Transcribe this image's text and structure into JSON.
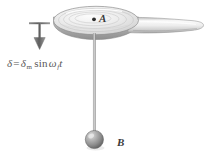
{
  "figure": {
    "name": "oscillating-paddle-pendulum-diagram",
    "background_color": "#ffffff",
    "width": 209,
    "height": 154
  },
  "equation": {
    "delta": "δ",
    "equals": "=",
    "delta_amplitude": "δ",
    "amplitude_subscript": "m",
    "sin": "sin",
    "omega": "ω",
    "omega_subscript": "f",
    "time": "t",
    "full_text": "δ = δm sin ωf t"
  },
  "labels": {
    "point_a": "A",
    "ball_b": "B"
  },
  "colors": {
    "body_light": "#f2f2f2",
    "body_mid": "#d8d8d8",
    "body_edge": "#9a9a9a",
    "outline": "#7d7d7d",
    "arrow": "#6b6b6b",
    "rod": "#a8a8a8",
    "sphere_light": "#cfcfcf",
    "sphere_dark": "#6f6f6f",
    "text": "#484848"
  },
  "elements": {
    "arrow": "down-arrow-icon",
    "paddle": "paddle-body",
    "point_marker": "point-a-marker",
    "rod": "pendulum-rod",
    "sphere": "pendulum-bob-sphere"
  }
}
